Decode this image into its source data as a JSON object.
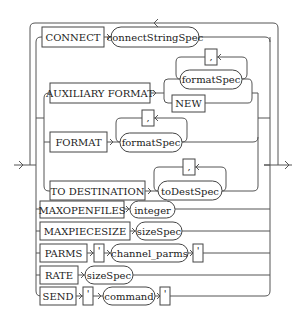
{
  "diagram": {
    "type": "railroad-syntax-diagram",
    "colors": {
      "line": "#555555",
      "box_border": "#444444",
      "text": "#222222",
      "background": "#ffffff"
    },
    "branches": [
      {
        "id": "connect",
        "keyword": "CONNECT",
        "items": [
          {
            "kind": "variable",
            "label": "connectStringSpec"
          }
        ],
        "loop_back": true
      },
      {
        "id": "auxiliary-format",
        "keyword": "AUXILIARY FORMAT",
        "choice": [
          {
            "kind": "variable",
            "label": "formatSpec",
            "repeat_separator": ","
          },
          {
            "kind": "keyword",
            "label": "NEW"
          }
        ]
      },
      {
        "id": "format",
        "keyword": "FORMAT",
        "items": [
          {
            "kind": "variable",
            "label": "formatSpec",
            "repeat_separator": ","
          }
        ]
      },
      {
        "id": "to-destination",
        "keyword": "TO DESTINATION",
        "items": [
          {
            "kind": "variable",
            "label": "toDestSpec",
            "repeat_separator": ","
          }
        ]
      },
      {
        "id": "maxopenfiles",
        "keyword": "MAXOPENFILES",
        "items": [
          {
            "kind": "variable",
            "label": "integer"
          }
        ]
      },
      {
        "id": "maxpiecesize",
        "keyword": "MAXPIECESIZE",
        "items": [
          {
            "kind": "variable",
            "label": "sizeSpec"
          }
        ]
      },
      {
        "id": "parms",
        "keyword": "PARMS",
        "items": [
          {
            "kind": "literal",
            "label": "'"
          },
          {
            "kind": "variable",
            "label": "channel_parms"
          },
          {
            "kind": "literal",
            "label": "'"
          }
        ]
      },
      {
        "id": "rate",
        "keyword": "RATE",
        "items": [
          {
            "kind": "variable",
            "label": "sizeSpec"
          }
        ]
      },
      {
        "id": "send",
        "keyword": "SEND",
        "items": [
          {
            "kind": "literal",
            "label": "'"
          },
          {
            "kind": "variable",
            "label": "command"
          },
          {
            "kind": "literal",
            "label": "'"
          }
        ]
      }
    ]
  },
  "labels": {
    "connect": "CONNECT",
    "connectStringSpec": "connectStringSpec",
    "auxiliary_format": "AUXILIARY FORMAT",
    "formatSpec": "formatSpec",
    "comma": ",",
    "new": "NEW",
    "format": "FORMAT",
    "to_destination": "TO DESTINATION",
    "toDestSpec": "toDestSpec",
    "maxopenfiles": "MAXOPENFILES",
    "integer": "integer",
    "maxpiecesize": "MAXPIECESIZE",
    "sizeSpec": "sizeSpec",
    "parms": "PARMS",
    "quote": "'",
    "channel_parms": "channel_parms",
    "rate": "RATE",
    "send": "SEND",
    "command": "command"
  }
}
